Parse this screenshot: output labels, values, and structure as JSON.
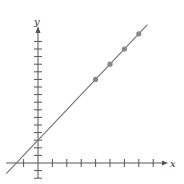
{
  "chart_data": {
    "type": "scatter",
    "title": "",
    "xlabel": "x",
    "ylabel": "y",
    "xlim": [
      -2,
      9
    ],
    "ylim": [
      -2,
      17
    ],
    "grid": false,
    "x_ticks_count": 9,
    "y_ticks_count": 17,
    "points": [
      {
        "x": 4,
        "y": 11
      },
      {
        "x": 5,
        "y": 13
      },
      {
        "x": 6,
        "y": 15
      },
      {
        "x": 7,
        "y": 17
      }
    ],
    "line": {
      "slope": 2,
      "intercept": 3
    },
    "colors": {
      "axis": "#555555",
      "line": "#777777",
      "point": "#888888"
    }
  },
  "labels": {
    "x_axis": "x",
    "y_axis": "y"
  }
}
